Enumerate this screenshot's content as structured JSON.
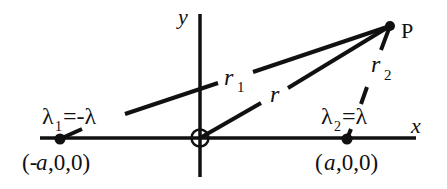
{
  "diagram": {
    "axes": {
      "x_label": "x",
      "y_label": "y"
    },
    "point_P": {
      "label": "P"
    },
    "distances": {
      "r1": "r",
      "r1_sub": "1",
      "r": "r",
      "r2": "r",
      "r2_sub": "2"
    },
    "charge_left": {
      "symbol": "λ",
      "sub": "1",
      "value": "=-λ",
      "coords_open": "(-",
      "coords_var": "a",
      "coords_rest": ",0,0)"
    },
    "charge_right": {
      "symbol": "λ",
      "sub": "2",
      "value": "=λ",
      "coords_open": "(",
      "coords_var": "a",
      "coords_rest": ",0,0)"
    },
    "colors": {
      "ink": "#111111",
      "background": "#ffffff"
    }
  }
}
